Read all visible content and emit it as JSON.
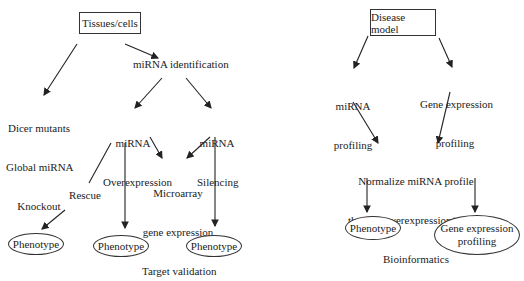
{
  "left_diagram": {
    "root": "Tissues/cells",
    "identification": "miRNA identification",
    "dicer": [
      "Dicer mutants",
      "Global miRNA",
      "Knockout"
    ],
    "overexpression": [
      "miRNA",
      "Overexpression"
    ],
    "silencing": [
      "miRNA",
      "Silencing"
    ],
    "microarray": [
      "Microarray",
      "gene expression",
      "Target validation"
    ],
    "rescue": "Rescue",
    "phenotypes": [
      "Phenotype",
      "Phenotype",
      "Phenotype"
    ]
  },
  "right_diagram": {
    "root": "Disease model",
    "mirna_profiling": [
      "miRNA",
      "profiling"
    ],
    "gene_profiling": [
      "Gene expression",
      "profiling"
    ],
    "normalize": [
      "Normalize miRNA profile",
      "through overexpression/silencing",
      "Bioinformatics"
    ],
    "phenotype": "Phenotype",
    "gene_outcome": [
      "Gene expression",
      "profiling"
    ]
  }
}
